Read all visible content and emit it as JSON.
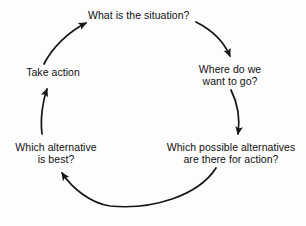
{
  "diagram": {
    "type": "cyclic-process",
    "stroke_color": "#151515",
    "background_color": "#fdfdfd",
    "text_color": "#101010",
    "nodes": [
      {
        "id": "situation",
        "name": "what-is-the-situation",
        "lines": [
          "What is the situation?"
        ],
        "position": "top"
      },
      {
        "id": "destination",
        "name": "where-do-we-want-to-go",
        "lines": [
          "Where do we",
          "want to go?"
        ],
        "position": "right"
      },
      {
        "id": "alternatives",
        "name": "which-possible-alternatives-are-there-for-action",
        "lines": [
          "Which possible alternatives",
          "are there for action?"
        ],
        "position": "bottom-right"
      },
      {
        "id": "best",
        "name": "which-alternative-is-best",
        "lines": [
          "Which alternative",
          "is best?"
        ],
        "position": "bottom-left"
      },
      {
        "id": "action",
        "name": "take-action",
        "lines": [
          "Take action"
        ],
        "position": "left"
      }
    ],
    "arrows": [
      {
        "id": "arrow-situation-to-destination",
        "from": "situation",
        "to": "destination"
      },
      {
        "id": "arrow-destination-to-alternatives",
        "from": "destination",
        "to": "alternatives"
      },
      {
        "id": "arrow-alternatives-to-best",
        "from": "alternatives",
        "to": "best"
      },
      {
        "id": "arrow-best-to-action",
        "from": "best",
        "to": "action"
      },
      {
        "id": "arrow-action-to-situation",
        "from": "action",
        "to": "situation"
      }
    ]
  }
}
